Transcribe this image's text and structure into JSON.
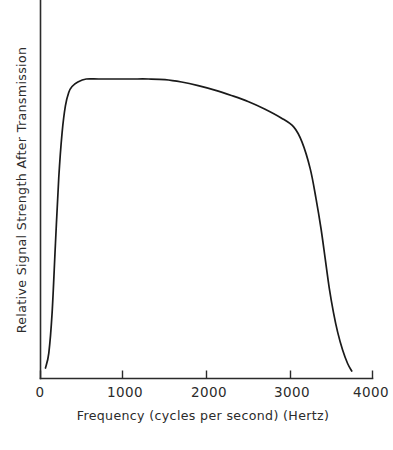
{
  "chart_data": {
    "type": "line",
    "title": "",
    "xlabel": "Frequency (cycles per second) (Hertz)",
    "ylabel": "Relative Signal Strength After Transmission",
    "xlim": [
      0,
      4000
    ],
    "ylim": [
      0,
      1.12
    ],
    "grid": false,
    "legend": null,
    "x_ticks": [
      {
        "value": 0,
        "label": "0"
      },
      {
        "value": 1000,
        "label": "1000"
      },
      {
        "value": 2000,
        "label": "2000"
      },
      {
        "value": 3000,
        "label": "3000"
      },
      {
        "value": 4000,
        "label": "4000"
      }
    ],
    "y_ticks": [],
    "series": [
      {
        "name": "Telephone channel transmission response",
        "x": [
          60,
          100,
          140,
          180,
          220,
          260,
          300,
          340,
          380,
          450,
          550,
          700,
          900,
          1100,
          1300,
          1500,
          1700,
          1900,
          2100,
          2300,
          2500,
          2700,
          2900,
          3050,
          3150,
          3250,
          3320,
          3380,
          3430,
          3480,
          3530,
          3580,
          3640,
          3700,
          3750
        ],
        "y": [
          0.035,
          0.085,
          0.22,
          0.45,
          0.67,
          0.82,
          0.91,
          0.955,
          0.975,
          0.99,
          1.0,
          1.0,
          1.0,
          1.0,
          1.0,
          0.998,
          0.99,
          0.978,
          0.963,
          0.945,
          0.925,
          0.9,
          0.87,
          0.84,
          0.79,
          0.7,
          0.6,
          0.5,
          0.4,
          0.3,
          0.22,
          0.155,
          0.095,
          0.05,
          0.025
        ]
      }
    ]
  },
  "axes": {
    "x_axis_label": "Frequency (cycles per second) (Hertz)",
    "y_axis_label": "Relative Signal Strength After Transmission",
    "tick_labels": [
      "0",
      "1000",
      "2000",
      "3000",
      "4000"
    ]
  },
  "colors": {
    "background": "#ffffff",
    "curve": "#1a1a1a",
    "axis": "#2b2b2b",
    "text": "#2b2b2b"
  }
}
